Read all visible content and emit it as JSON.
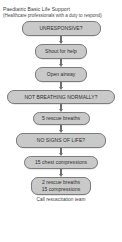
{
  "header": {
    "title": "Paediatric Basic Life Support",
    "subtitle": "(Healthcare professionals with a duty to respond)"
  },
  "colors": {
    "node_fill": "#c9c9c9",
    "node_border": "#7c7c7c",
    "arrow": "#6f6f6f",
    "text": "#2f2f2f",
    "background": "#ffffff"
  },
  "flow": {
    "nodes": [
      {
        "id": "unresponsive",
        "label": "UNRESPONSIVE?"
      },
      {
        "id": "shout-for-help",
        "label": "Shout for help"
      },
      {
        "id": "open-airway",
        "label": "Open airway"
      },
      {
        "id": "not-breathing-normally",
        "label": "NOT BREATHING NORMALLY?"
      },
      {
        "id": "five-rescue-breaths",
        "label": "5 rescue breaths"
      },
      {
        "id": "no-signs-of-life",
        "label": "NO SIGNS OF LIFE?"
      },
      {
        "id": "fifteen-chest-compressions",
        "label": "15 chest compressions"
      },
      {
        "id": "cycle",
        "label_line1": "2 rescue breaths",
        "label_line2": "15 compressions"
      }
    ],
    "footer_note": "Call resuscitation team"
  }
}
